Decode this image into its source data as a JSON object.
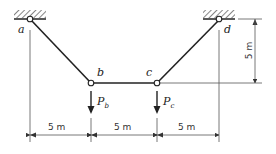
{
  "diagram": {
    "type": "cable structure with point loads",
    "nodes": {
      "a": {
        "label": "a",
        "support": "pinned"
      },
      "b": {
        "label": "b"
      },
      "c": {
        "label": "c"
      },
      "d": {
        "label": "d",
        "support": "pinned"
      }
    },
    "loads": {
      "pb": {
        "symbol": "P",
        "subscript": "b"
      },
      "pc": {
        "symbol": "P",
        "subscript": "c"
      }
    },
    "dimensions": {
      "span_ab": "5 m",
      "span_bc": "5 m",
      "span_cd": "5 m",
      "sag": "5 m"
    },
    "colors": {
      "member": "#222222",
      "dimension": "#555555"
    }
  }
}
